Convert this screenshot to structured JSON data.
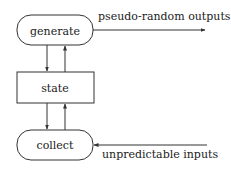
{
  "diagram": {
    "nodes": {
      "generate": {
        "label": "generate",
        "shape": "rounded-rect"
      },
      "state": {
        "label": "state",
        "shape": "rect"
      },
      "collect": {
        "label": "collect",
        "shape": "rounded-rect"
      }
    },
    "edges": {
      "output": {
        "label": "pseudo-random outputs",
        "from": "generate",
        "to": "external"
      },
      "input": {
        "label": "unpredictable inputs",
        "from": "external",
        "to": "collect"
      },
      "generate_to_state": {
        "from": "generate",
        "to": "state"
      },
      "state_to_generate": {
        "from": "state",
        "to": "generate"
      },
      "state_to_collect": {
        "from": "state",
        "to": "collect"
      },
      "collect_to_state": {
        "from": "collect",
        "to": "state"
      }
    },
    "colors": {
      "stroke": "#333333",
      "background": "#ffffff",
      "text": "#222222"
    }
  }
}
